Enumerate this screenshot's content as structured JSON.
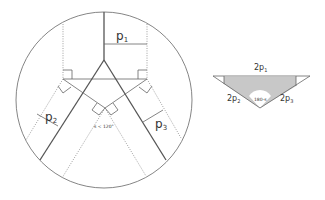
{
  "left_diagram": {
    "labels": {
      "p1": {
        "base": "p",
        "sub": "1"
      },
      "p2": {
        "base": "p",
        "sub": "2"
      },
      "p3": {
        "base": "p",
        "sub": "3"
      },
      "angle": "s < 120°"
    }
  },
  "right_diagram": {
    "labels": {
      "top": {
        "base": "2p",
        "sub": "1"
      },
      "left": {
        "base": "2p",
        "sub": "2"
      },
      "right": {
        "base": "2p",
        "sub": "3"
      },
      "angle": "180-s"
    },
    "fill_color": "#c8c8c8"
  }
}
